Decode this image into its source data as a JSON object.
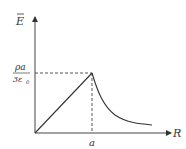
{
  "diagram": {
    "type": "line",
    "y_axis_label": "E",
    "y_axis_label_has_bar": true,
    "x_axis_label": "R",
    "x_tick_label": "a",
    "y_tick_label_numerator": "ρa",
    "y_tick_label_denominator": "3ε",
    "y_tick_label_denominator_sub": "0",
    "colors": {
      "line": "#333333",
      "dashed": "#333333",
      "background": "#ffffff"
    }
  }
}
